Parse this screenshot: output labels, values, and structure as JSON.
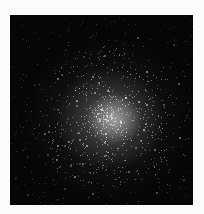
{
  "image": {
    "subject": "globular star cluster",
    "background_color": "#060606",
    "border_color": "#fbfbfb",
    "core_center": [
      104,
      104
    ]
  }
}
